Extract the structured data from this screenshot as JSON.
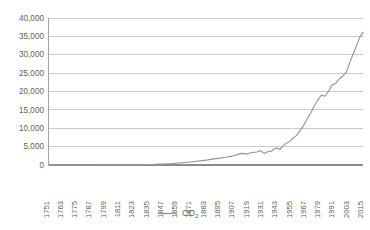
{
  "chart_data": {
    "type": "line",
    "title": "",
    "xlabel": "",
    "ylabel": "",
    "grid": true,
    "legend_position": "bottom-center",
    "ylim": [
      0,
      40000
    ],
    "xlim": [
      1751,
      2015
    ],
    "ytick_labels": [
      "40,000",
      "35,000",
      "30,000",
      "25,000",
      "20,000",
      "15,000",
      "10,000",
      "5,000",
      "0"
    ],
    "ytick_values": [
      40000,
      35000,
      30000,
      25000,
      20000,
      15000,
      10000,
      5000,
      0
    ],
    "xtick_labels": [
      "1751",
      "1763",
      "1775",
      "1787",
      "1799",
      "1811",
      "1823",
      "1835",
      "1847",
      "1859",
      "1871",
      "1883",
      "1895",
      "1907",
      "1919",
      "1931",
      "1943",
      "1955",
      "1967",
      "1979",
      "1991",
      "2003",
      "2015"
    ],
    "xtick_values": [
      1751,
      1763,
      1775,
      1787,
      1799,
      1811,
      1823,
      1835,
      1847,
      1859,
      1871,
      1883,
      1895,
      1907,
      1919,
      1931,
      1943,
      1955,
      1967,
      1979,
      1991,
      2003,
      2015
    ],
    "series": [
      {
        "name": "CO2",
        "legend_label": "CO",
        "legend_label_sub": "2",
        "color": "#969696",
        "x": [
          1751,
          1760,
          1770,
          1780,
          1790,
          1800,
          1810,
          1820,
          1830,
          1840,
          1850,
          1855,
          1860,
          1865,
          1870,
          1875,
          1880,
          1885,
          1890,
          1895,
          1900,
          1905,
          1910,
          1913,
          1916,
          1918,
          1920,
          1923,
          1926,
          1929,
          1932,
          1935,
          1938,
          1940,
          1943,
          1945,
          1947,
          1950,
          1953,
          1956,
          1959,
          1962,
          1965,
          1968,
          1971,
          1974,
          1977,
          1980,
          1983,
          1986,
          1989,
          1992,
          1995,
          1998,
          2001,
          2004,
          2007,
          2010,
          2012,
          2015
        ],
        "y": [
          3,
          5,
          8,
          12,
          18,
          30,
          45,
          65,
          95,
          160,
          310,
          400,
          530,
          680,
          830,
          1020,
          1200,
          1400,
          1650,
          1870,
          2100,
          2400,
          2900,
          3150,
          3100,
          2950,
          3250,
          3450,
          3550,
          3950,
          3150,
          3600,
          3750,
          4300,
          4650,
          4200,
          4900,
          5800,
          6300,
          7200,
          8000,
          9300,
          10700,
          12500,
          14100,
          16000,
          17600,
          19000,
          18700,
          20000,
          21800,
          22200,
          23400,
          24200,
          25200,
          28000,
          30400,
          32800,
          34600,
          36100
        ]
      }
    ]
  },
  "legend": {
    "label_main": "CO",
    "label_sub": "2"
  }
}
